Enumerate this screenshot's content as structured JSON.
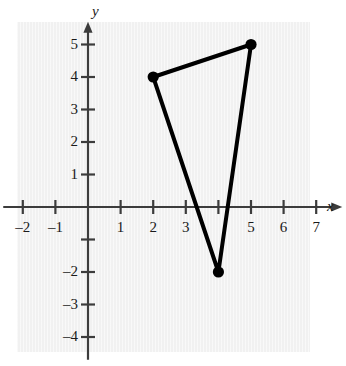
{
  "chart_data": {
    "type": "scatter",
    "title": "",
    "xlabel": "x",
    "ylabel": "y",
    "xlim": [
      -2.6,
      7.8
    ],
    "ylim": [
      -4.7,
      5.7
    ],
    "grid": false,
    "legend": null,
    "x_ticks": [
      -2,
      -1,
      1,
      2,
      3,
      4,
      5,
      6,
      7
    ],
    "x_tick_labels": [
      "–2",
      "–1",
      "1",
      "2",
      "3",
      "",
      "5",
      "6",
      "7"
    ],
    "y_ticks": [
      5,
      4,
      3,
      2,
      1,
      -1,
      -2,
      -3,
      -4
    ],
    "y_tick_labels": [
      "5",
      "4",
      "3",
      "2",
      "1",
      "",
      "–2",
      "–3",
      "–4"
    ],
    "series": [
      {
        "name": "triangle",
        "shape": "closed-polygon",
        "points": [
          {
            "x": 2,
            "y": 4
          },
          {
            "x": 5,
            "y": 5
          },
          {
            "x": 4,
            "y": -2
          }
        ],
        "marker": "filled-circle",
        "color": "#000000",
        "line_width": 4
      }
    ],
    "annotations": []
  },
  "axes": {
    "x_axis_label": "x",
    "y_axis_label": "y",
    "arrow_x": "arrow-right",
    "arrow_y": "arrow-up",
    "axis_color": "#3c3c3c"
  },
  "colors": {
    "panel": "#f1f1f1",
    "axis": "#3c3c3c",
    "ink": "#000000",
    "text": "#1a1a1a"
  }
}
